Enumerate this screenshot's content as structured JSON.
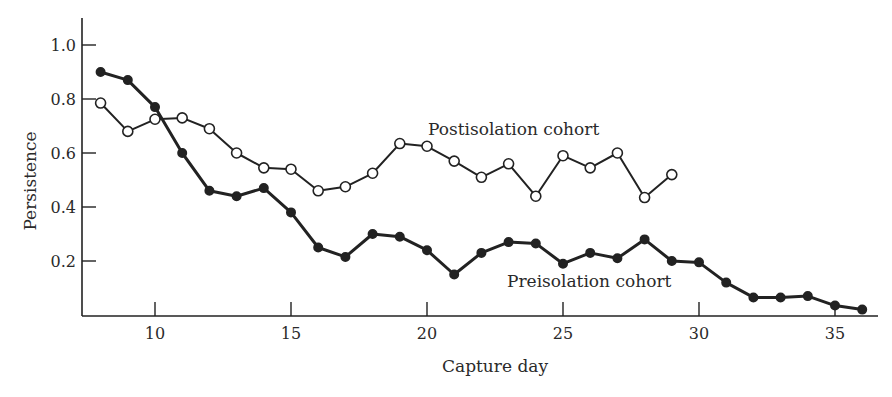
{
  "chart_data": {
    "type": "line",
    "title": "",
    "xlabel": "Capture day",
    "ylabel": "Persistence",
    "xlim": [
      7.2,
      37.5
    ],
    "ylim": [
      0,
      1.1
    ],
    "xticks": [
      10,
      15,
      20,
      25,
      30,
      35
    ],
    "yticks": [
      0.2,
      0.4,
      0.6,
      0.8,
      1.0
    ],
    "ytick_labels": [
      "0.2",
      "0.4",
      "0.6",
      "0.8",
      "1.0"
    ],
    "grid": false,
    "legend": "inline labels",
    "series": [
      {
        "name": "Preisolation cohort",
        "marker": "filled-circle",
        "label_pos": {
          "x": 507,
          "y": 287
        },
        "x": [
          8,
          9,
          10,
          11,
          12,
          13,
          14,
          15,
          16,
          17,
          18,
          19,
          20,
          21,
          22,
          23,
          24,
          25,
          26,
          27,
          28,
          29,
          30,
          31,
          32,
          33,
          34,
          35,
          36
        ],
        "values": [
          0.9,
          0.87,
          0.77,
          0.6,
          0.46,
          0.44,
          0.47,
          0.38,
          0.25,
          0.215,
          0.3,
          0.29,
          0.24,
          0.15,
          0.23,
          0.27,
          0.265,
          0.19,
          0.23,
          0.21,
          0.28,
          0.2,
          0.195,
          0.12,
          0.065,
          0.065,
          0.07,
          0.035,
          0.02
        ]
      },
      {
        "name": "Postisolation cohort",
        "marker": "open-circle",
        "label_pos": {
          "x": 428,
          "y": 135
        },
        "x": [
          8,
          9,
          10,
          11,
          12,
          13,
          14,
          15,
          16,
          17,
          18,
          19,
          20,
          21,
          22,
          23,
          24,
          25,
          26,
          27,
          28,
          29
        ],
        "values": [
          0.785,
          0.68,
          0.725,
          0.73,
          0.69,
          0.6,
          0.545,
          0.54,
          0.46,
          0.475,
          0.525,
          0.635,
          0.625,
          0.57,
          0.51,
          0.56,
          0.44,
          0.59,
          0.545,
          0.6,
          0.435,
          0.52
        ]
      }
    ]
  }
}
